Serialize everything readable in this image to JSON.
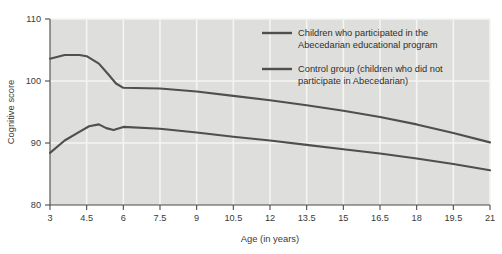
{
  "chart_data": {
    "type": "line",
    "title": "",
    "xlabel": "Age (in years)",
    "ylabel": "Cognitive score",
    "xlim": [
      3,
      21
    ],
    "ylim": [
      80,
      110
    ],
    "xticks": [
      3,
      4.5,
      6,
      7.5,
      9,
      10.5,
      12,
      13.5,
      15,
      16.5,
      18,
      19.5,
      21
    ],
    "xtick_labels": [
      "3",
      "4.5",
      "6",
      "7.5",
      "9",
      "10.5",
      "12",
      "13.5",
      "15",
      "16.5",
      "18",
      "19.5",
      "21"
    ],
    "yticks": [
      80,
      90,
      100,
      110
    ],
    "ytick_labels": [
      "80",
      "90",
      "100",
      "110"
    ],
    "grid": "both-white-on-gray",
    "legend_position": "top-right-inside",
    "series": [
      {
        "name": "Children who participated in the Abecedarian educational program",
        "color": "#4f4f4f",
        "x": [
          3,
          3.6,
          4.2,
          4.5,
          5.0,
          5.4,
          5.7,
          6.0,
          7.5,
          9,
          10.5,
          12,
          13.5,
          15,
          16.5,
          18,
          19.5,
          21
        ],
        "values": [
          103.6,
          104.2,
          104.2,
          104.0,
          102.8,
          101.0,
          99.6,
          98.9,
          98.8,
          98.3,
          97.6,
          96.9,
          96.1,
          95.2,
          94.2,
          93.0,
          91.6,
          90.1
        ]
      },
      {
        "name": "Control group (children who did not participate in Abecedarian)",
        "color": "#4f4f4f",
        "x": [
          3,
          3.6,
          4.2,
          4.6,
          5.0,
          5.3,
          5.6,
          6.0,
          7.5,
          9,
          10.5,
          12,
          13.5,
          15,
          16.5,
          18,
          19.5,
          21
        ],
        "values": [
          88.4,
          90.4,
          91.8,
          92.7,
          93.0,
          92.4,
          92.1,
          92.6,
          92.3,
          91.7,
          91.0,
          90.4,
          89.7,
          89.0,
          88.3,
          87.5,
          86.6,
          85.6
        ]
      }
    ]
  },
  "legend": {
    "entries": [
      {
        "line1": "Children who participated in the",
        "line2": "Abecedarian educational program"
      },
      {
        "line1": "Control group (children who did not",
        "line2": "participate in Abecedarian)"
      }
    ]
  }
}
